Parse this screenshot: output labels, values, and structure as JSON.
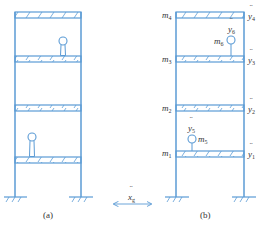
{
  "colors": {
    "structure": "#5B9BD5",
    "text": "#333333",
    "background": "#ffffff"
  },
  "panel_a": {
    "caption": "(a)",
    "floors": 4,
    "appendages": [
      {
        "floor": 3,
        "description": "lollipop appendage on 3rd floor slab"
      },
      {
        "floor": 1,
        "description": "lollipop appendage on 1st floor slab"
      }
    ]
  },
  "panel_b": {
    "caption": "(b)",
    "floor_masses": [
      {
        "label": "m",
        "sub": "1",
        "accel_label": "y",
        "accel_sub": "1"
      },
      {
        "label": "m",
        "sub": "2",
        "accel_label": "y",
        "accel_sub": "2"
      },
      {
        "label": "m",
        "sub": "3",
        "accel_label": "y",
        "accel_sub": "3"
      },
      {
        "label": "m",
        "sub": "4",
        "accel_label": "y",
        "accel_sub": "4"
      }
    ],
    "appendage_masses": [
      {
        "label": "m",
        "sub": "5",
        "accel_label": "y",
        "accel_sub": "5"
      },
      {
        "label": "m",
        "sub": "6",
        "accel_label": "y",
        "accel_sub": "6"
      }
    ]
  },
  "ground_motion": {
    "label": "x",
    "sub": "g"
  }
}
